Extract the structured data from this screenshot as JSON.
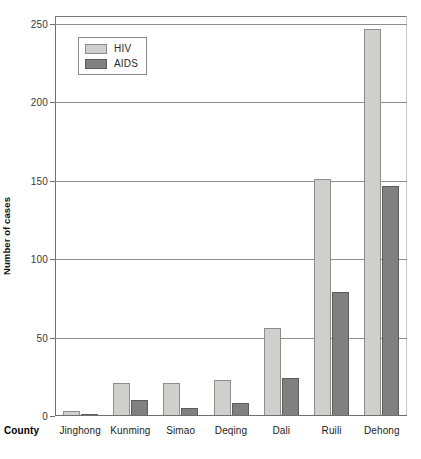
{
  "chart_data": {
    "type": "bar",
    "title": "",
    "xlabel": "County",
    "ylabel": "Number of cases",
    "ylim": [
      0,
      250
    ],
    "yticks": [
      0,
      50,
      100,
      150,
      200,
      250
    ],
    "grid": true,
    "legend_position": "top-left-inside",
    "categories": [
      "Jinghong",
      "Kunming",
      "Simao",
      "Deqing",
      "Dali",
      "Ruili",
      "Dehong"
    ],
    "series": [
      {
        "name": "HIV",
        "color": "#cfcfcb",
        "values": [
          3,
          21,
          21,
          23,
          56,
          151,
          247
        ]
      },
      {
        "name": "AIDS",
        "color": "#808080",
        "values": [
          1,
          10,
          5,
          8,
          24,
          79,
          147
        ]
      }
    ]
  },
  "axis": {
    "y_title": "Number of cases",
    "x_title": "County",
    "tick_labels": [
      "0",
      "50",
      "100",
      "150",
      "200",
      "250"
    ]
  },
  "legend": {
    "items": [
      {
        "label": "HIV"
      },
      {
        "label": "AIDS"
      }
    ]
  }
}
